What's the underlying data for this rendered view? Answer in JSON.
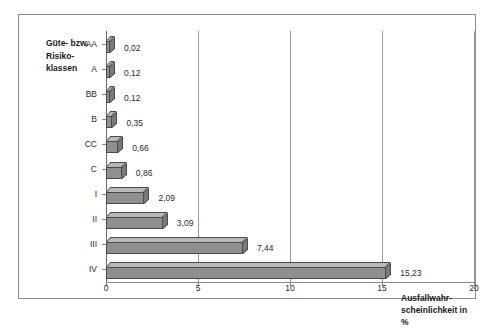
{
  "chart_data": {
    "type": "bar",
    "orientation": "horizontal",
    "style": "3d",
    "title": "",
    "subtitle": "",
    "xlabel": "Ausfallwahr-\nscheinlichkeit in %",
    "ylabel": "Güte- bzw.\nRisiko-\nklassen",
    "categories": [
      "AA",
      "A",
      "BB",
      "B",
      "CC",
      "C",
      "I",
      "II",
      "III",
      "IV"
    ],
    "values": [
      0.02,
      0.12,
      0.12,
      0.35,
      0.66,
      0.86,
      2.09,
      3.09,
      7.44,
      15.23
    ],
    "value_labels": [
      "0,02",
      "0,12",
      "0,12",
      "0,35",
      "0,66",
      "0,86",
      "2,09",
      "3,09",
      "7,44",
      "15,23"
    ],
    "xlim": [
      0,
      20
    ],
    "xticks": [
      0,
      5,
      10,
      15,
      20
    ],
    "xtick_labels": [
      "0",
      "5",
      "10",
      "15",
      "20"
    ],
    "grid": true,
    "grid_axis": "x",
    "legend": null,
    "colors": {
      "bar_front": "#8f8f8f",
      "bar_top": "#b8b8b8",
      "bar_side": "#7a7a7a",
      "bar_outline": "#4a4a4a",
      "gridline": "#9a9a9a",
      "axis": "#8a8a8a",
      "frame": "#8d8d8d",
      "background": "#ffffff",
      "text": "#1a1a1a"
    }
  },
  "axis_titles": {
    "y": "Güte- bzw.\nRisiko-\nklassen",
    "x": "Ausfallwahr-\nscheinlichkeit in %"
  }
}
